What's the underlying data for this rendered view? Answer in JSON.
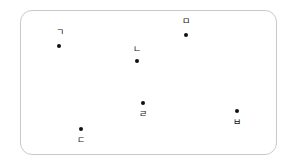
{
  "figure": {
    "type": "point-diagram",
    "width": 294,
    "height": 163,
    "background_color": "#ffffff"
  },
  "frame": {
    "name": "rounded-rectangle-boundary",
    "x": 20,
    "y": 10,
    "width": 257,
    "height": 145,
    "corner_radius": 12,
    "border_color": "#c9c9c9",
    "border_width": 1,
    "fill_color": "#ffffff"
  },
  "marker_style": {
    "shape": "filled-dot",
    "color": "#111111",
    "size": 4
  },
  "label_style": {
    "color": "#111111",
    "font_size": 9
  },
  "points": [
    {
      "id": "point-giyeok",
      "label": "ㄱ",
      "marker_x": 59,
      "marker_y": 46,
      "label_x": 60,
      "label_y": 32,
      "label_position": "above"
    },
    {
      "id": "point-nieun",
      "label": "ㄴ",
      "marker_x": 137,
      "marker_y": 61,
      "label_x": 137,
      "label_y": 49,
      "label_position": "above"
    },
    {
      "id": "point-mieum",
      "label": "ㅁ",
      "marker_x": 186,
      "marker_y": 35,
      "label_x": 186,
      "label_y": 21,
      "label_position": "above"
    },
    {
      "id": "point-rieul",
      "label": "ㄹ",
      "marker_x": 143,
      "marker_y": 103,
      "label_x": 143,
      "label_y": 114,
      "label_position": "below"
    },
    {
      "id": "point-bieup",
      "label": "ㅂ",
      "marker_x": 237,
      "marker_y": 111,
      "label_x": 237,
      "label_y": 122,
      "label_position": "below"
    },
    {
      "id": "point-digeut",
      "label": "ㄷ",
      "marker_x": 81,
      "marker_y": 129,
      "label_x": 81,
      "label_y": 140,
      "label_position": "below"
    }
  ]
}
